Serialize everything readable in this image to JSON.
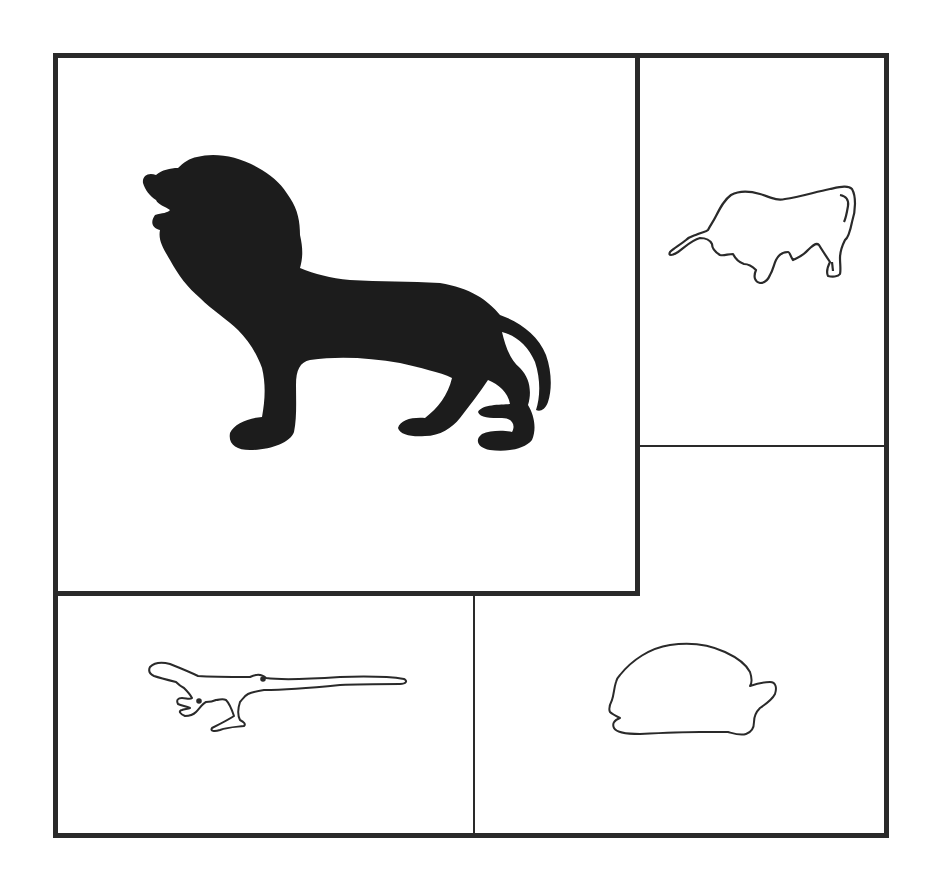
{
  "figure": {
    "layout": "five-panel grid of animal silhouettes",
    "line_color": "#2a2a2a",
    "fill_color": "#1c1c1c",
    "background": "#ffffff"
  },
  "panels": [
    {
      "id": "lion",
      "label": "lion",
      "style": "filled silhouette",
      "icon": "lion-icon"
    },
    {
      "id": "bull",
      "label": "bull",
      "style": "outline",
      "icon": "bull-icon"
    },
    {
      "id": "empty",
      "label": "empty panel",
      "style": "blank"
    },
    {
      "id": "lizard",
      "label": "lizard",
      "style": "outline",
      "icon": "lizard-icon"
    },
    {
      "id": "turtle",
      "label": "turtle",
      "style": "outline",
      "icon": "turtle-icon"
    }
  ]
}
